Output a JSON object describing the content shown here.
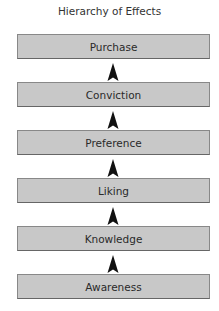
{
  "diagram": {
    "title": "Hierarchy of Effects",
    "stages": [
      {
        "label": "Purchase"
      },
      {
        "label": "Conviction"
      },
      {
        "label": "Preference"
      },
      {
        "label": "Liking"
      },
      {
        "label": "Knowledge"
      },
      {
        "label": "Awareness"
      }
    ],
    "arrow_direction": "up",
    "box_color": "#c8c8c8",
    "arrow_color": "#111111"
  }
}
